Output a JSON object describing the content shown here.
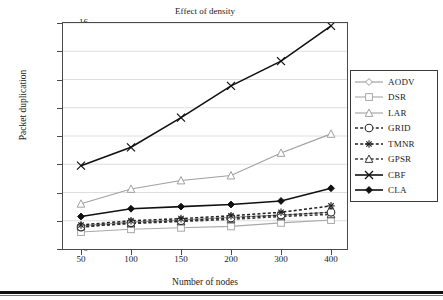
{
  "chart_data": {
    "type": "line",
    "title": "Effect of density",
    "xlabel": "Number of nodes",
    "ylabel": "Packet duplication",
    "categories": [
      "50",
      "100",
      "150",
      "200",
      "300",
      "400"
    ],
    "ylim": [
      0,
      16
    ],
    "yticks": [
      "0",
      "2",
      "4",
      "6",
      "8",
      "10",
      "12",
      "14",
      "16"
    ],
    "grid": "horizontal",
    "legend_position": "right",
    "series": [
      {
        "name": "AODV",
        "marker": "diamond-open",
        "line": "solid",
        "color": "#9a9a9a",
        "values": [
          1.65,
          1.9,
          2.05,
          2.25,
          2.4,
          2.6
        ]
      },
      {
        "name": "DSR",
        "marker": "square-open",
        "line": "solid",
        "color": "#a8a8a8",
        "values": [
          1.2,
          1.4,
          1.5,
          1.6,
          1.85,
          2.05
        ]
      },
      {
        "name": "LAR",
        "marker": "triangle-open",
        "line": "solid",
        "color": "#a0a0a0",
        "values": [
          3.2,
          4.25,
          4.85,
          5.2,
          6.8,
          8.15
        ]
      },
      {
        "name": "GRID",
        "marker": "circle-open",
        "line": "dashed",
        "color": "#2b2b2b",
        "values": [
          1.55,
          1.85,
          2.0,
          2.2,
          2.4,
          2.6
        ]
      },
      {
        "name": "TMNR",
        "marker": "asterisk",
        "line": "dashed",
        "color": "#1f1f1f",
        "values": [
          1.7,
          2.0,
          2.15,
          2.35,
          2.6,
          3.05
        ]
      },
      {
        "name": "GPSR",
        "marker": "triangle-open",
        "line": "dashed",
        "color": "#3a3a3a",
        "values": [
          1.6,
          1.8,
          1.95,
          2.1,
          2.3,
          2.45
        ]
      },
      {
        "name": "CBF",
        "marker": "x-cross",
        "line": "solid",
        "color": "#111111",
        "values": [
          5.9,
          7.2,
          9.3,
          11.55,
          13.3,
          15.8
        ]
      },
      {
        "name": "CLA",
        "marker": "diamond-fill",
        "line": "solid",
        "color": "#111111",
        "values": [
          2.3,
          2.85,
          3.0,
          3.15,
          3.4,
          4.3
        ]
      }
    ]
  }
}
